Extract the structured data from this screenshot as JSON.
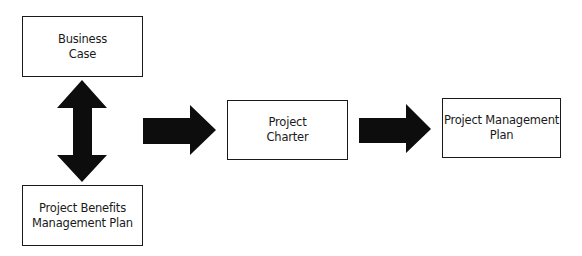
{
  "diagram": {
    "type": "flowchart",
    "nodes": [
      {
        "id": "business-case",
        "label": "Business\nCase"
      },
      {
        "id": "benefits-plan",
        "label": "Project Benefits\nManagement Plan"
      },
      {
        "id": "project-charter",
        "label": "Project\nCharter"
      },
      {
        "id": "pm-plan",
        "label": "Project Management\nPlan"
      }
    ],
    "edges": [
      {
        "from": "business-case",
        "to": "benefits-plan",
        "style": "bidirectional-block-arrow"
      },
      {
        "from": "business-case+benefits-plan",
        "to": "project-charter",
        "style": "block-arrow"
      },
      {
        "from": "project-charter",
        "to": "pm-plan",
        "style": "block-arrow"
      }
    ],
    "colors": {
      "stroke": "#1a1a1a",
      "arrow_fill": "#0d0d0d",
      "box_fill": "#ffffff",
      "background": "#ffffff"
    }
  }
}
